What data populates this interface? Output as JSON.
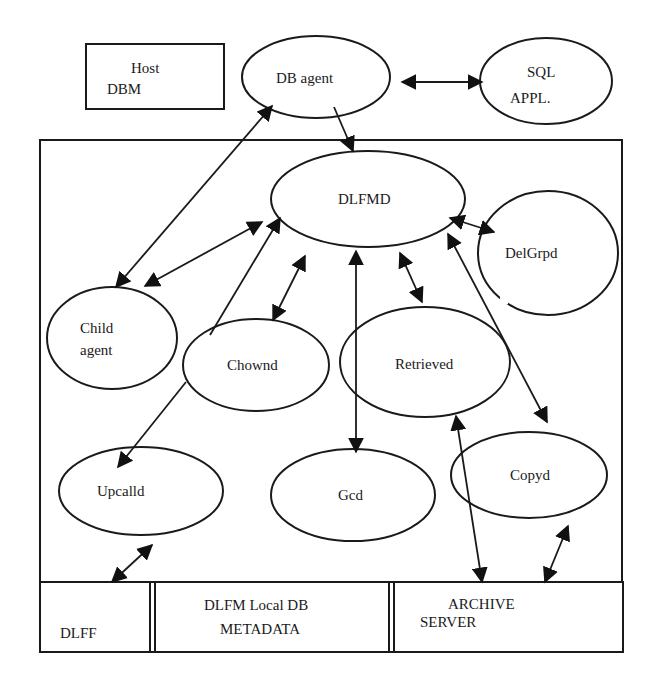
{
  "diagram": {
    "type": "architecture-diagram",
    "nodes": {
      "host_dbm": {
        "lines": [
          "Host",
          "DBM"
        ],
        "shape": "box"
      },
      "db_agent": {
        "lines": [
          "DB agent"
        ],
        "shape": "ellipse"
      },
      "sql_appl": {
        "lines": [
          "SQL",
          "APPL."
        ],
        "shape": "ellipse"
      },
      "dlfmd": {
        "lines": [
          "DLFMD"
        ],
        "shape": "ellipse"
      },
      "delgrpd": {
        "lines": [
          "DelGrpd"
        ],
        "shape": "ellipse"
      },
      "child_agent": {
        "lines": [
          "Child",
          "agent"
        ],
        "shape": "ellipse"
      },
      "chownd": {
        "lines": [
          "Chownd"
        ],
        "shape": "ellipse"
      },
      "retrieved": {
        "lines": [
          "Retrieved"
        ],
        "shape": "ellipse"
      },
      "upcalld": {
        "lines": [
          "Upcalld"
        ],
        "shape": "ellipse"
      },
      "gcd": {
        "lines": [
          "Gcd"
        ],
        "shape": "ellipse"
      },
      "copyd": {
        "lines": [
          "Copyd"
        ],
        "shape": "ellipse"
      },
      "dlff": {
        "lines": [
          "DLFF"
        ],
        "shape": "box"
      },
      "dlfm_local_db": {
        "lines": [
          "DLFM Local DB",
          "METADATA"
        ],
        "shape": "box"
      },
      "archive_server": {
        "lines": [
          "ARCHIVE",
          "SERVER"
        ],
        "shape": "box"
      }
    },
    "edges": [
      {
        "from": "db_agent",
        "to": "sql_appl",
        "direction": "both"
      },
      {
        "from": "db_agent",
        "to": "dlfmd",
        "direction": "forward"
      },
      {
        "from": "child_agent",
        "to": "db_agent",
        "direction": "both"
      },
      {
        "from": "child_agent",
        "to": "dlfmd",
        "direction": "both"
      },
      {
        "from": "chownd",
        "to": "dlfmd",
        "direction": "forward"
      },
      {
        "from": "chownd",
        "to": "dlfmd",
        "direction": "both"
      },
      {
        "from": "chownd",
        "to": "upcalld",
        "direction": "forward"
      },
      {
        "from": "dlfmd",
        "to": "gcd",
        "direction": "both"
      },
      {
        "from": "dlfmd",
        "to": "retrieved",
        "direction": "both"
      },
      {
        "from": "dlfmd",
        "to": "delgrpd",
        "direction": "both"
      },
      {
        "from": "dlfmd",
        "to": "copyd",
        "direction": "both"
      },
      {
        "from": "upcalld",
        "to": "dlff",
        "direction": "both"
      },
      {
        "from": "retrieved",
        "to": "archive_server",
        "direction": "both"
      },
      {
        "from": "copyd",
        "to": "archive_server",
        "direction": "both"
      }
    ]
  }
}
